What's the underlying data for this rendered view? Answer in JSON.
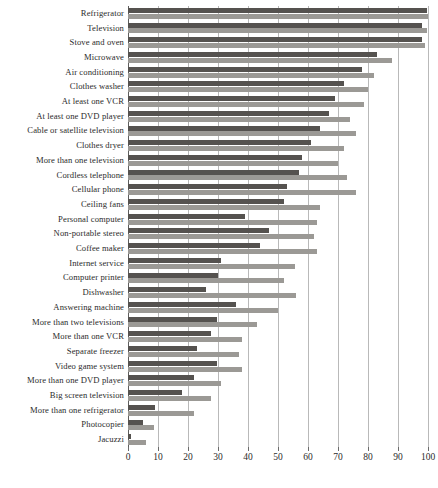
{
  "chart_data": {
    "type": "bar",
    "orientation": "horizontal",
    "title": "",
    "subtitle": "",
    "xlabel": "",
    "ylabel": "",
    "xlim": [
      0,
      100
    ],
    "xticks": [
      0,
      10,
      20,
      30,
      40,
      50,
      60,
      70,
      80,
      90,
      100
    ],
    "grid": true,
    "legend": "none",
    "categories": [
      "Refrigerator",
      "Television",
      "Stove and oven",
      "Microwave",
      "Air conditioning",
      "Clothes washer",
      "At least one VCR",
      "At least one DVD player",
      "Cable or satellite television",
      "Clothes dryer",
      "More than one television",
      "Cordless telephone",
      "Cellular phone",
      "Ceiling fans",
      "Personal computer",
      "Non-portable stereo",
      "Coffee maker",
      "Internet service",
      "Computer printer",
      "Dishwasher",
      "Answering machine",
      "More than two televisions",
      "More than one VCR",
      "Separate freezer",
      "Video game system",
      "More than one DVD player",
      "Big screen television",
      "More than one refrigerator",
      "Photocopier",
      "Jacuzzi"
    ],
    "series": [
      {
        "name": "series-a",
        "color": "#55524f",
        "values": [
          99.5,
          98.0,
          98.0,
          83.0,
          78.0,
          72.0,
          69.0,
          67.0,
          64.0,
          61.0,
          58.0,
          57.0,
          53.0,
          52.0,
          39.0,
          47.0,
          44.0,
          31.0,
          30.0,
          26.0,
          36.0,
          29.5,
          27.5,
          23.0,
          29.5,
          22.0,
          18.0,
          9.0,
          5.0,
          1.0
        ]
      },
      {
        "name": "series-b",
        "color": "#9b9995",
        "values": [
          100.0,
          99.5,
          99.0,
          88.0,
          82.0,
          80.0,
          78.5,
          74.0,
          76.0,
          72.0,
          70.0,
          73.0,
          76.0,
          64.0,
          63.0,
          62.0,
          63.0,
          55.5,
          52.0,
          56.0,
          50.0,
          43.0,
          38.0,
          37.0,
          38.0,
          31.0,
          27.5,
          22.0,
          8.5,
          6.0
        ]
      }
    ]
  },
  "axis": {
    "tick_labels": [
      "0",
      "10",
      "20",
      "30",
      "40",
      "50",
      "60",
      "70",
      "80",
      "90",
      "100"
    ]
  },
  "caption": {
    "text": ""
  }
}
